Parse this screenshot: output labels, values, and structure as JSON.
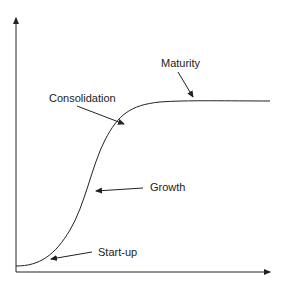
{
  "diagram": {
    "title": "",
    "x_axis_label": "",
    "y_axis_label": "",
    "stages": [
      {
        "label": "Start-up",
        "x": 99,
        "y": 101
      },
      {
        "label": "Growth",
        "x": 150,
        "y": 42
      },
      {
        "label": "Consolidation",
        "x": 50,
        "y": 99
      },
      {
        "label": "Maturity",
        "x": 160,
        "y": 63
      }
    ],
    "colors": {
      "line": "#222222",
      "text": "#222222",
      "background": "#ffffff"
    }
  }
}
